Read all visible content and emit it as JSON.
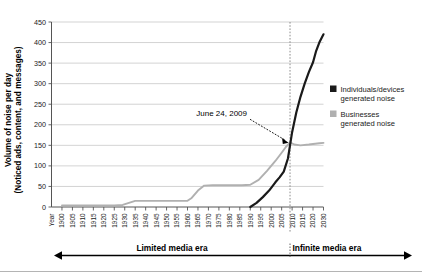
{
  "figure": {
    "background_color": "#ffffff",
    "top_cropped_text": "",
    "footer_rule_color": "#b4b4b4"
  },
  "chart_data": {
    "type": "line",
    "title": "",
    "xlabel": "Year",
    "ylabel": "Volume of noise per day (Noticed ads, content, and messages)",
    "ylabel_line1": "Volume of noise per day",
    "ylabel_line2": "(Noticed ads, content, and messages)",
    "xlim": [
      1895,
      2030
    ],
    "ylim": [
      0,
      450
    ],
    "yticks": [
      0,
      50,
      100,
      150,
      200,
      250,
      300,
      350,
      400,
      450
    ],
    "xticks": [
      1900,
      1905,
      1910,
      1915,
      1920,
      1925,
      1930,
      1935,
      1940,
      1945,
      1950,
      1955,
      1960,
      1965,
      1970,
      1975,
      1980,
      1985,
      1990,
      1995,
      2000,
      2005,
      2010,
      2015,
      2020,
      2030
    ],
    "xtick_labels": [
      "1900",
      "1905",
      "1910",
      "1915",
      "1920",
      "1925",
      "1930",
      "1935",
      "1940",
      "1945",
      "1950",
      "1955",
      "1960",
      "1965",
      "1970",
      "1975",
      "1980",
      "1985",
      "1990",
      "1995",
      "2000",
      "2005",
      "2010",
      "2015",
      "2020",
      "2030"
    ],
    "xaxis_origin_label": "Year",
    "grid": "horizontal",
    "grid_color": "#c8c8c8",
    "legend_position": "right",
    "series": [
      {
        "name": "Individuals/devices generated noise",
        "label_line1": "Individuals/devices",
        "label_line2": "generated noise",
        "color": "#1a1a1a",
        "x": [
          1990,
          1993,
          1996,
          1999,
          2002,
          2004,
          2006,
          2008,
          2009,
          2010,
          2012,
          2014,
          2016,
          2018,
          2020,
          2023,
          2026,
          2030
        ],
        "y": [
          0,
          10,
          24,
          40,
          60,
          72,
          86,
          118,
          150,
          182,
          230,
          268,
          300,
          328,
          352,
          380,
          400,
          420
        ]
      },
      {
        "name": "Businesses generated noise",
        "label_line1": "Businesses",
        "label_line2": "generated noise",
        "color": "#b0b0b0",
        "x": [
          1900,
          1915,
          1925,
          1929,
          1932,
          1935,
          1945,
          1955,
          1960,
          1962,
          1965,
          1968,
          1972,
          1980,
          1986,
          1990,
          1994,
          1998,
          2002,
          2005,
          2007,
          2009,
          2011,
          2014,
          2018,
          2022,
          2026,
          2030
        ],
        "y": [
          4,
          4,
          4,
          5,
          10,
          15,
          15,
          15,
          15,
          22,
          40,
          52,
          53,
          53,
          53,
          54,
          66,
          88,
          112,
          132,
          146,
          157,
          152,
          150,
          152,
          154,
          155,
          156
        ]
      }
    ],
    "annotations": [
      {
        "text": "June 24, 2009",
        "x": 2009,
        "y": 155,
        "marker": "arrow-dashed",
        "color": "#000000"
      }
    ],
    "vertical_marker": {
      "x": 2009,
      "style": "dotted",
      "color": "#808080"
    }
  },
  "eras": {
    "left_label": "Limited media era",
    "right_label": "Infinite media era",
    "divider_x": 2009,
    "arrow_color": "#000000"
  },
  "legend": {
    "items": [
      {
        "swatch_color": "#1a1a1a",
        "line1": "Individuals/devices",
        "line2": "generated noise"
      },
      {
        "swatch_color": "#b0b0b0",
        "line1": "Businesses",
        "line2": "generated noise"
      }
    ]
  }
}
